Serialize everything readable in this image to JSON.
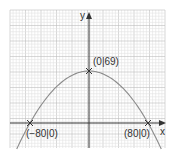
{
  "chart_data": {
    "type": "line",
    "title": "",
    "xlabel": "x",
    "ylabel": "y",
    "function": "y = 69 - (69/6400) * x^2",
    "grid": true,
    "xlim": [
      -100,
      105
    ],
    "ylim": [
      -33,
      145
    ],
    "series": [
      {
        "name": "parabola",
        "x": [
          -95,
          -80,
          -60,
          -40,
          -20,
          0,
          20,
          40,
          60,
          80,
          95
        ],
        "y": [
          -28.3,
          0,
          30.2,
          51.75,
          64.7,
          69,
          64.7,
          51.75,
          30.2,
          0,
          -28.3
        ]
      }
    ],
    "points": [
      {
        "x": -80,
        "y": 0,
        "label": "(−80|0)"
      },
      {
        "x": 0,
        "y": 69,
        "label": "(0|69)"
      },
      {
        "x": 80,
        "y": 0,
        "label": "(80|0)"
      }
    ],
    "colors": {
      "curve": "#8a8a8a",
      "axes": "#333333",
      "grid_minor": "#e2e2e2",
      "grid_major": "#bdbdbd",
      "marker": "#333333"
    }
  },
  "labels": {
    "x_axis": "x",
    "y_axis": "y",
    "vertex": "(0|69)",
    "left_root": "(−80|0)",
    "right_root": "(80|0)"
  }
}
